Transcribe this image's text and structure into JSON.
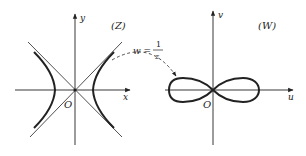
{
  "figure": {
    "left_panel": {
      "plane_label": "(Z)",
      "x_axis_label": "x",
      "y_axis_label": "y",
      "origin_label": "O",
      "curve": "hyperbola",
      "asymptotes": "y = ±x"
    },
    "right_panel": {
      "plane_label": "(W)",
      "u_axis_label": "u",
      "v_axis_label": "v",
      "origin_label": "O",
      "curve": "lemniscate"
    },
    "mapping": {
      "lhs": "w =",
      "numerator": "1",
      "denominator": "z"
    },
    "colors": {
      "ink": "#222222",
      "background": "#ffffff"
    }
  }
}
